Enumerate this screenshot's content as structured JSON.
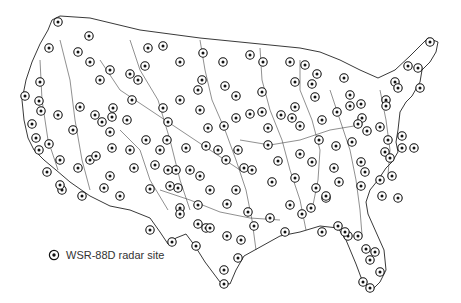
{
  "legend": {
    "label": "WSR-88D radar site",
    "icon": "radar-site-marker-icon"
  },
  "colors": {
    "border": "#222222",
    "river": "#333333",
    "marker_ring": "#111111",
    "background": "#ffffff",
    "text": "#333333"
  },
  "outline": "M60,16 L90,18 L140,30 L200,38 L270,45 L300,48 L320,52 L340,60 L360,70 L378,78 L395,70 L410,56 L428,38 L438,42 L436,52 L430,62 L422,70 L420,82 L412,96 L406,102 L400,112 L398,130 L396,142 L398,152 L392,162 L386,168 L378,180 L370,190 L366,202 L368,214 L376,232 L384,250 L386,270 L380,282 L372,290 L362,280 L356,264 L346,240 L338,228 L320,226 L300,232 L280,236 L262,246 L244,256 L236,270 L230,284 L220,282 L205,262 L195,246 L186,234 L176,238 L168,244 L160,232 L150,218 L130,210 L110,206 L90,196 L70,182 L56,170 L44,160 L34,150 L28,138 L24,120 L22,100 L26,80 L32,62 L40,44 L48,30 L52,20 Z",
  "sites": [
    [
      58,
      22
    ],
    [
      89,
      36
    ],
    [
      78,
      52
    ],
    [
      49,
      48
    ],
    [
      40,
      82
    ],
    [
      25,
      96
    ],
    [
      39,
      101
    ],
    [
      41,
      111
    ],
    [
      58,
      115
    ],
    [
      80,
      107
    ],
    [
      113,
      108
    ],
    [
      112,
      117
    ],
    [
      163,
      46
    ],
    [
      203,
      53
    ],
    [
      223,
      62
    ],
    [
      250,
      55
    ],
    [
      262,
      92
    ],
    [
      263,
      62
    ],
    [
      290,
      62
    ],
    [
      295,
      82
    ],
    [
      305,
      65
    ],
    [
      317,
      74
    ],
    [
      315,
      97
    ],
    [
      295,
      107
    ],
    [
      281,
      115
    ],
    [
      292,
      118
    ],
    [
      312,
      84
    ],
    [
      344,
      78
    ],
    [
      350,
      95
    ],
    [
      386,
      100
    ],
    [
      395,
      82
    ],
    [
      408,
      66
    ],
    [
      418,
      68
    ],
    [
      430,
      42
    ],
    [
      398,
      88
    ],
    [
      420,
      88
    ],
    [
      322,
      120
    ],
    [
      337,
      112
    ],
    [
      350,
      106
    ],
    [
      361,
      104
    ],
    [
      362,
      118
    ],
    [
      386,
      106
    ],
    [
      367,
      131
    ],
    [
      380,
      127
    ],
    [
      388,
      140
    ],
    [
      385,
      152
    ],
    [
      361,
      162
    ],
    [
      365,
      172
    ],
    [
      390,
      158
    ],
    [
      402,
      136
    ],
    [
      414,
      148
    ],
    [
      402,
      148
    ],
    [
      380,
      180
    ],
    [
      392,
      176
    ],
    [
      398,
      198
    ],
    [
      382,
      196
    ],
    [
      361,
      186
    ],
    [
      339,
      182
    ],
    [
      326,
      198
    ],
    [
      316,
      188
    ],
    [
      311,
      208
    ],
    [
      322,
      232
    ],
    [
      338,
      226
    ],
    [
      348,
      236
    ],
    [
      358,
      236
    ],
    [
      366,
      249
    ],
    [
      375,
      252
    ],
    [
      370,
      260
    ],
    [
      380,
      272
    ],
    [
      370,
      288
    ],
    [
      363,
      282
    ],
    [
      345,
      232
    ],
    [
      326,
      196
    ],
    [
      302,
      214
    ],
    [
      285,
      232
    ],
    [
      290,
      205
    ],
    [
      270,
      218
    ],
    [
      254,
      226
    ],
    [
      248,
      212
    ],
    [
      241,
      240
    ],
    [
      227,
      236
    ],
    [
      224,
      270
    ],
    [
      224,
      284
    ],
    [
      206,
      228
    ],
    [
      198,
      205
    ],
    [
      180,
      208
    ],
    [
      178,
      188
    ],
    [
      150,
      189
    ],
    [
      155,
      165
    ],
    [
      176,
      170
    ],
    [
      190,
      170
    ],
    [
      206,
      146
    ],
    [
      218,
      150
    ],
    [
      238,
      150
    ],
    [
      244,
      168
    ],
    [
      236,
      190
    ],
    [
      227,
      204
    ],
    [
      252,
      170
    ],
    [
      272,
      182
    ],
    [
      278,
      161
    ],
    [
      300,
      154
    ],
    [
      295,
      178
    ],
    [
      312,
      162
    ],
    [
      334,
      168
    ],
    [
      336,
      146
    ],
    [
      352,
      142
    ],
    [
      358,
      124
    ],
    [
      319,
      140
    ],
    [
      300,
      126
    ],
    [
      262,
      112
    ],
    [
      268,
      145
    ],
    [
      268,
      128
    ],
    [
      236,
      118
    ],
    [
      224,
      126
    ],
    [
      208,
      128
    ],
    [
      200,
      110
    ],
    [
      180,
      100
    ],
    [
      168,
      122
    ],
    [
      167,
      140
    ],
    [
      160,
      150
    ],
    [
      168,
      170
    ],
    [
      170,
      186
    ],
    [
      180,
      214
    ],
    [
      198,
      224
    ],
    [
      210,
      228
    ],
    [
      210,
      190
    ],
    [
      200,
      176
    ],
    [
      226,
      160
    ],
    [
      186,
      148
    ],
    [
      163,
      108
    ],
    [
      138,
      80
    ],
    [
      127,
      120
    ],
    [
      110,
      132
    ],
    [
      112,
      148
    ],
    [
      95,
      115
    ],
    [
      102,
      122
    ],
    [
      90,
      160
    ],
    [
      104,
      188
    ],
    [
      110,
      176
    ],
    [
      96,
      156
    ],
    [
      73,
      130
    ],
    [
      78,
      168
    ],
    [
      60,
      160
    ],
    [
      62,
      190
    ],
    [
      49,
      144
    ],
    [
      39,
      150
    ],
    [
      32,
      124
    ],
    [
      36,
      138
    ],
    [
      47,
      172
    ],
    [
      60,
      185
    ],
    [
      82,
      196
    ],
    [
      120,
      196
    ],
    [
      150,
      230
    ],
    [
      172,
      242
    ],
    [
      196,
      246
    ],
    [
      238,
      258
    ],
    [
      130,
      150
    ],
    [
      146,
      140
    ],
    [
      134,
      168
    ],
    [
      90,
      62
    ],
    [
      100,
      80
    ],
    [
      110,
      70
    ],
    [
      130,
      74
    ],
    [
      145,
      66
    ],
    [
      148,
      48
    ],
    [
      132,
      100
    ],
    [
      180,
      62
    ],
    [
      202,
      80
    ],
    [
      225,
      86
    ],
    [
      236,
      96
    ],
    [
      250,
      114
    ],
    [
      198,
      90
    ]
  ],
  "rivers": [
    "M200,40 L205,70 L212,100 L225,130 L236,160 L246,190 L252,220 L256,250",
    "M260,48 L262,80 L270,110 L282,140 L290,170 L300,200 L306,230",
    "M100,60 L120,90 L150,110 L180,130 L210,150 L240,170",
    "M300,60 L300,90 L312,120 L320,150 L318,180 L312,210",
    "M60,40 L70,80 L75,120 L82,160 L90,190",
    "M130,40 L140,70 L158,100 L170,140 L180,180 L190,210",
    "M330,90 L340,120 L350,150 L356,180 L360,210 L362,235",
    "M380,90 L386,120 L390,150 L388,175",
    "M160,190 L190,200 L220,212 L250,218 L280,220",
    "M240,140 L270,145 L300,140 L330,130 L360,125",
    "M40,60 L42,100 L48,140 L58,170",
    "M120,130 L140,150 L150,180 L168,210"
  ]
}
